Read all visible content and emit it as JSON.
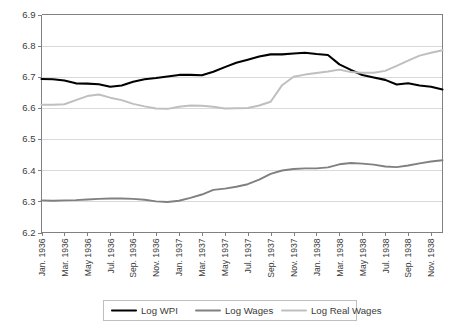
{
  "chart_data": {
    "type": "line",
    "title": "",
    "xlabel": "",
    "ylabel": "",
    "ylim": [
      6.2,
      6.9
    ],
    "yticks": [
      "6.2",
      "6.3",
      "6.4",
      "6.5",
      "6.6",
      "6.7",
      "6.8",
      "6.9"
    ],
    "grid": true,
    "legend_position": "bottom",
    "colors": {
      "log_wpi": "#000000",
      "log_wages": "#808080",
      "log_real_wages": "#bfbfbf",
      "gridline": "#d9d9d9",
      "axis": "#808080",
      "text": "#3a3a3a"
    },
    "x": [
      "Jan. 1936",
      "Feb. 1936",
      "Mar. 1936",
      "Apr. 1936",
      "May 1936",
      "Jun. 1936",
      "Jul. 1936",
      "Aug. 1936",
      "Sep. 1936",
      "Oct. 1936",
      "Nov. 1936",
      "Dec. 1936",
      "Jan. 1937",
      "Feb. 1937",
      "Mar. 1937",
      "Apr. 1937",
      "May 1937",
      "Jun. 1937",
      "Jul. 1937",
      "Aug. 1937",
      "Sep. 1937",
      "Oct. 1937",
      "Nov. 1937",
      "Dec. 1937",
      "Jan. 1938",
      "Feb. 1938",
      "Mar. 1938",
      "Apr. 1938",
      "May 1938",
      "Jun. 1938",
      "Jul. 1938",
      "Aug. 1938",
      "Sep. 1938",
      "Oct. 1938",
      "Nov. 1938",
      "Dec. 1938"
    ],
    "xtick_labels": [
      "Jan. 1936",
      "Mar. 1936",
      "May 1936",
      "Jul. 1936",
      "Sep. 1936",
      "Nov. 1936",
      "Jan. 1937",
      "Mar. 1937",
      "May 1937",
      "Jul. 1937",
      "Sep. 1937",
      "Nov. 1937",
      "Jan. 1938",
      "Mar. 1938",
      "May 1938",
      "Jul. 1938",
      "Sep. 1938",
      "Nov. 1938"
    ],
    "xtick_indices": [
      0,
      2,
      4,
      6,
      8,
      10,
      12,
      14,
      16,
      18,
      20,
      22,
      24,
      26,
      28,
      30,
      32,
      34
    ],
    "series": [
      {
        "name": "Log WPI",
        "color": "#000000",
        "width": 2.1,
        "values": [
          6.693,
          6.692,
          6.688,
          6.679,
          6.678,
          6.676,
          6.668,
          6.672,
          6.684,
          6.692,
          6.696,
          6.701,
          6.706,
          6.706,
          6.705,
          6.716,
          6.731,
          6.745,
          6.755,
          6.765,
          6.772,
          6.772,
          6.775,
          6.777,
          6.773,
          6.77,
          6.74,
          6.722,
          6.706,
          6.698,
          6.69,
          6.675,
          6.679,
          6.672,
          6.668,
          6.659
        ]
      },
      {
        "name": "Log Wages",
        "color": "#808080",
        "width": 1.9,
        "values": [
          6.303,
          6.302,
          6.303,
          6.304,
          6.306,
          6.308,
          6.309,
          6.309,
          6.308,
          6.305,
          6.3,
          6.298,
          6.302,
          6.311,
          6.322,
          6.337,
          6.341,
          6.347,
          6.355,
          6.37,
          6.388,
          6.399,
          6.404,
          6.406,
          6.406,
          6.409,
          6.419,
          6.423,
          6.421,
          6.418,
          6.412,
          6.41,
          6.415,
          6.422,
          6.428,
          6.432
        ]
      },
      {
        "name": "Log Real Wages",
        "color": "#bfbfbf",
        "width": 2.0,
        "values": [
          6.61,
          6.61,
          6.612,
          6.625,
          6.638,
          6.643,
          6.633,
          6.625,
          6.613,
          6.605,
          6.598,
          6.597,
          6.604,
          6.608,
          6.607,
          6.604,
          6.598,
          6.599,
          6.6,
          6.608,
          6.62,
          6.673,
          6.7,
          6.707,
          6.712,
          6.717,
          6.723,
          6.715,
          6.713,
          6.713,
          6.719,
          6.735,
          6.752,
          6.768,
          6.777,
          6.785
        ]
      }
    ],
    "legend_entries": [
      {
        "label": "Log WPI",
        "color": "#000000",
        "width": 2.1
      },
      {
        "label": "Log Wages",
        "color": "#808080",
        "width": 1.9
      },
      {
        "label": "Log Real Wages",
        "color": "#bfbfbf",
        "width": 2.0
      }
    ]
  }
}
